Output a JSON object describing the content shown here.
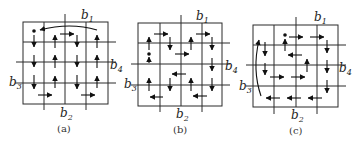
{
  "figure": {
    "panels": [
      {
        "id": "a",
        "caption": "(a)",
        "labels": {
          "b1": {
            "base": "b",
            "sub": "1"
          },
          "b2": {
            "base": "b",
            "sub": "2"
          },
          "b3": {
            "base": "b",
            "sub": "3"
          },
          "b4": {
            "base": "b",
            "sub": "4"
          }
        },
        "description": "Boustrophedon column-wise path with start dot at top-left cell and a curved return arc along the top edge"
      },
      {
        "id": "b",
        "caption": "(b)",
        "labels": {
          "b1": {
            "base": "b",
            "sub": "1"
          },
          "b2": {
            "base": "b",
            "sub": "2"
          },
          "b3": {
            "base": "b",
            "sub": "3"
          },
          "b4": {
            "base": "b",
            "sub": "4"
          }
        },
        "description": "Quadrant-based serpentine path with start dot in left column"
      },
      {
        "id": "c",
        "caption": "(c)",
        "labels": {
          "b1": {
            "base": "b",
            "sub": "1"
          },
          "b2": {
            "base": "b",
            "sub": "2"
          },
          "b3": {
            "base": "b",
            "sub": "3"
          },
          "b4": {
            "base": "b",
            "sub": "4"
          }
        },
        "description": "Spiral path with start dot near top, curved return arc along left edge"
      }
    ],
    "colors": {
      "line": "#2a2a2a",
      "arrow": "#111111",
      "text": "#222222"
    }
  }
}
